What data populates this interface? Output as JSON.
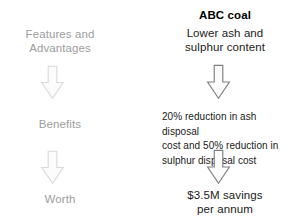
{
  "diagram": {
    "columns": [
      {
        "name": "ladder",
        "steps": [
          {
            "label": "Features and\nAdvantages",
            "icon": "down-arrow-icon"
          },
          {
            "label": "Benefits",
            "icon": "down-arrow-icon"
          },
          {
            "label": "Worth"
          }
        ]
      },
      {
        "name": "example",
        "heading": "ABC coal",
        "steps": [
          {
            "label": "Lower ash and\nsulphur content",
            "icon": "down-arrow-icon"
          },
          {
            "label": "20% reduction in ash disposal\ncost and 50% reduction in\nsulphur disposal cost",
            "icon": "down-arrow-icon"
          },
          {
            "label": "$3.5M savings\nper annum"
          }
        ]
      }
    ]
  },
  "colors": {
    "background": "#ffffff",
    "ladder_text": "#9d9d9d",
    "ladder_arrow_stroke": "#d9d9d9",
    "ladder_arrow_fill": "#fcfcfc",
    "example_text": "#1a1a1a",
    "example_heading": "#000000",
    "example_arrow_stroke": "#7f7f7f",
    "example_arrow_fill": "#fbfbfb"
  }
}
